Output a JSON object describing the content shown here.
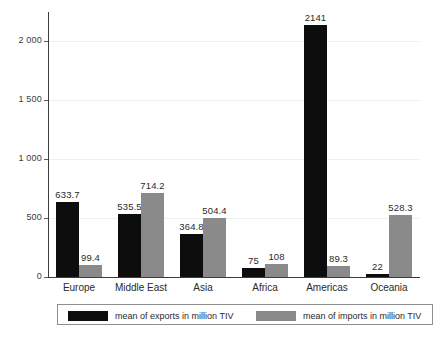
{
  "chart_data": {
    "type": "bar",
    "title": "",
    "xlabel": "",
    "ylabel": "",
    "ylim": [
      0,
      2250
    ],
    "grid": true,
    "grid_axis": "y",
    "legend_position": "bottom",
    "categories": [
      "Europe",
      "Middle East",
      "Asia",
      "Africa",
      "Americas",
      "Oceania"
    ],
    "ytick_labels": [
      "2 000",
      "1 500",
      "1 000",
      "500",
      "0"
    ],
    "ytick_values": [
      2000,
      1500,
      1000,
      500,
      0
    ],
    "series": [
      {
        "name": "mean of exports in million TIV",
        "color": "#0d0d0d",
        "values": [
          633.7,
          535.5,
          364.8,
          75,
          2141,
          22
        ],
        "labels": [
          "633.7",
          "535.5",
          "364.8",
          "75",
          "2141",
          "22"
        ]
      },
      {
        "name": "mean of imports in million TIV",
        "color": "#8a8a8a",
        "values": [
          99.4,
          714.2,
          504.4,
          108,
          89.3,
          528.3
        ],
        "labels": [
          "99.4",
          "714.2",
          "504.4",
          "108",
          "89.3",
          "528.3"
        ]
      }
    ]
  },
  "legend": {
    "entries": [
      {
        "label": "mean of exports in million TIV",
        "swatch": "exports"
      },
      {
        "label": "mean of imports in million TIV",
        "swatch": "imports"
      }
    ]
  },
  "colors": {
    "exports": "#0d0d0d",
    "imports": "#8a8a8a",
    "axis": "#3c3c3c",
    "grid": "#f0f0f0",
    "background": "#ffffff"
  }
}
